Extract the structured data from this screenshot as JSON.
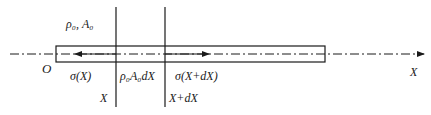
{
  "diagram": {
    "labels": {
      "density_area": "ρ₀, A₀",
      "origin": "O",
      "stress_left": "σ(X)",
      "element_mass": "ρ₀A₀dX",
      "stress_right": "σ(X+dX)",
      "section_left": "X",
      "section_right": "X+dX",
      "axis": "X"
    },
    "colors": {
      "stroke": "#1a1a1a",
      "background": "#ffffff"
    }
  }
}
